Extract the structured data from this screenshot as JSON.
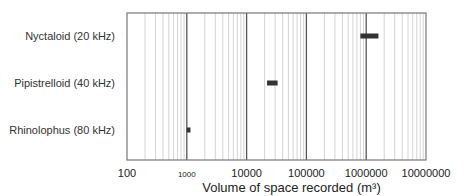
{
  "chart_data": {
    "type": "bar",
    "orientation": "horizontal-range",
    "title": "",
    "xlabel": "Volume of space recorded (m³)",
    "ylabel": "",
    "xscale": "log",
    "xlim": [
      100,
      10000000
    ],
    "grid": true,
    "legend": null,
    "xticks": [
      "100",
      "1000",
      "10000",
      "100000",
      "1000000",
      "10000000"
    ],
    "categories": [
      "Nyctaloid (20 kHz)",
      "Pipistrelloid (40 kHz)",
      "Rhinolophus (80 kHz)"
    ],
    "series": [
      {
        "name": "Volume range",
        "ranges": [
          {
            "category": "Nyctaloid (20 kHz)",
            "min": 800000,
            "max": 1600000
          },
          {
            "category": "Pipistrelloid (40 kHz)",
            "min": 22000,
            "max": 33000
          },
          {
            "category": "Rhinolophus (80 kHz)",
            "min": 1000,
            "max": 1150
          }
        ]
      }
    ],
    "colors": {
      "bar": "#333333",
      "major_grid": "#555555",
      "minor_grid": "#d4d4d4",
      "frame": "#777777"
    }
  }
}
